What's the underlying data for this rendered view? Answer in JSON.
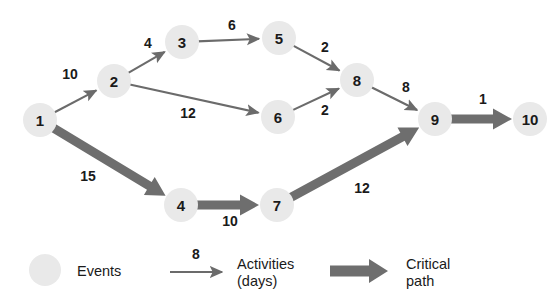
{
  "chart_data": {
    "type": "diagram",
    "title": "",
    "diagram_kind": "pert-cpm-network",
    "nodes": [
      {
        "id": "1",
        "label": "1",
        "x": 40,
        "y": 120,
        "r": 17
      },
      {
        "id": "2",
        "label": "2",
        "x": 114,
        "y": 81,
        "r": 17
      },
      {
        "id": "3",
        "label": "3",
        "x": 182,
        "y": 42,
        "r": 17
      },
      {
        "id": "4",
        "label": "4",
        "x": 181,
        "y": 205,
        "r": 17
      },
      {
        "id": "5",
        "label": "5",
        "x": 279,
        "y": 38,
        "r": 17
      },
      {
        "id": "6",
        "label": "6",
        "x": 278,
        "y": 117,
        "r": 17
      },
      {
        "id": "7",
        "label": "7",
        "x": 277,
        "y": 205,
        "r": 17
      },
      {
        "id": "8",
        "label": "8",
        "x": 357,
        "y": 80,
        "r": 17
      },
      {
        "id": "9",
        "label": "9",
        "x": 435,
        "y": 119,
        "r": 17
      },
      {
        "id": "10",
        "label": "10",
        "x": 530,
        "y": 119,
        "r": 17
      }
    ],
    "edges": [
      {
        "from": "1",
        "to": "2",
        "label": "10",
        "label_x": 70,
        "label_y": 74,
        "critical": false
      },
      {
        "from": "2",
        "to": "3",
        "label": "4",
        "label_x": 148,
        "label_y": 43,
        "critical": false
      },
      {
        "from": "3",
        "to": "5",
        "label": "6",
        "label_x": 232,
        "label_y": 25,
        "critical": false
      },
      {
        "from": "5",
        "to": "8",
        "label": "2",
        "label_x": 325,
        "label_y": 47,
        "critical": false
      },
      {
        "from": "2",
        "to": "6",
        "label": "12",
        "label_x": 188,
        "label_y": 113,
        "critical": false
      },
      {
        "from": "6",
        "to": "8",
        "label": "2",
        "label_x": 325,
        "label_y": 110,
        "critical": false
      },
      {
        "from": "8",
        "to": "9",
        "label": "8",
        "label_x": 406,
        "label_y": 87,
        "critical": false
      },
      {
        "from": "1",
        "to": "4",
        "label": "15",
        "label_x": 88,
        "label_y": 176,
        "critical": true
      },
      {
        "from": "4",
        "to": "7",
        "label": "10",
        "label_x": 230,
        "label_y": 221,
        "critical": true
      },
      {
        "from": "7",
        "to": "9",
        "label": "12",
        "label_x": 362,
        "label_y": 188,
        "critical": true
      },
      {
        "from": "9",
        "to": "10",
        "label": "1",
        "label_x": 483,
        "label_y": 99,
        "critical": true
      }
    ],
    "legend": {
      "events": {
        "symbol": "circle",
        "label": "Events",
        "circle_x": 45,
        "circle_y": 270,
        "circle_r": 16,
        "label_x": 77,
        "label_y": 271
      },
      "activities": {
        "symbol": "thin-arrow",
        "label_line_1": "Activities",
        "label_line_2": "(days)",
        "value_label": "8",
        "value_x": 196,
        "value_y": 254,
        "arrow_x1": 170,
        "arrow_x2": 222,
        "arrow_y": 272,
        "label_x": 237,
        "label_y_1": 264,
        "label_y_2": 281
      },
      "critical_path": {
        "symbol": "thick-arrow",
        "label_line_1": "Critical",
        "label_line_2": "path",
        "arrow_x1": 330,
        "arrow_x2": 388,
        "arrow_y": 271,
        "label_x": 406,
        "label_y_1": 264,
        "label_y_2": 281
      }
    },
    "colors": {
      "node_fill": "#e9e9e9",
      "node_text": "#1a1a1a",
      "edge_stroke": "#6b6b6b",
      "critical_fill": "#6e6e6e",
      "background": "#ffffff"
    }
  }
}
